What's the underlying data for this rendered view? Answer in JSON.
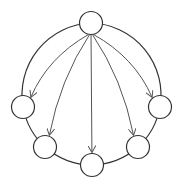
{
  "diagram": {
    "type": "directed-graph",
    "stroke_color": "#333333",
    "arrow_color": "#555555",
    "node_fill": "#ffffff",
    "node_radius": 11.5,
    "nodes": [
      {
        "id": "top",
        "x": 91,
        "y": 23
      },
      {
        "id": "right",
        "x": 160,
        "y": 107
      },
      {
        "id": "lower-right",
        "x": 138,
        "y": 147
      },
      {
        "id": "bottom",
        "x": 92,
        "y": 165
      },
      {
        "id": "lower-left",
        "x": 45,
        "y": 147
      },
      {
        "id": "left",
        "x": 23,
        "y": 107
      }
    ],
    "ring_edges": [
      [
        "top",
        "right"
      ],
      [
        "right",
        "lower-right"
      ],
      [
        "lower-right",
        "bottom"
      ],
      [
        "bottom",
        "lower-left"
      ],
      [
        "lower-left",
        "left"
      ],
      [
        "left",
        "top"
      ]
    ],
    "arrows": [
      {
        "from": "top",
        "to": "left"
      },
      {
        "from": "top",
        "to": "lower-left"
      },
      {
        "from": "top",
        "to": "bottom"
      },
      {
        "from": "top",
        "to": "lower-right"
      },
      {
        "from": "top",
        "to": "right"
      }
    ]
  }
}
